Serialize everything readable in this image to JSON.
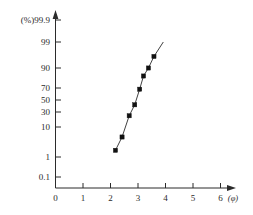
{
  "chart_data": {
    "type": "scatter",
    "title": "",
    "subtitle": "",
    "xlabel": "(φ)",
    "ylabel": "(%)",
    "grid": false,
    "legend": "none",
    "y_scale": "probability",
    "x_scale": "linear",
    "xlim": [
      0,
      6.6
    ],
    "x_ticks": [
      "0",
      "1",
      "2",
      "3",
      "4",
      "5",
      "6"
    ],
    "x_tick_values": [
      0,
      1,
      2,
      3,
      4,
      5,
      6
    ],
    "y_ticks": [
      "99.9",
      "99",
      "90",
      "70",
      "50",
      "30",
      "10",
      "1",
      "0.1"
    ],
    "y_tick_values": [
      99.9,
      99,
      90,
      70,
      50,
      30,
      10,
      1,
      0.1
    ],
    "y_top_label_prefix": "(%)",
    "series": [
      {
        "name": "cumulative-frequency",
        "x": [
          2.18,
          2.42,
          2.68,
          2.88,
          3.06,
          3.2,
          3.38,
          3.58
        ],
        "y": [
          3.0,
          7.0,
          25.0,
          42.0,
          68.0,
          82.0,
          90.0,
          94.0
        ],
        "marker": "filled-square",
        "line": true,
        "color": "#2b2b2b"
      }
    ],
    "trend_line": {
      "x_start": 2.18,
      "y_start": 3.0,
      "x_end": 3.92,
      "y_end": 99.0
    },
    "annotations": []
  },
  "axes": {
    "x_axis_name": "phi-axis",
    "y_axis_name": "percent-probability-axis",
    "x_arrow": true,
    "y_arrow": true
  }
}
